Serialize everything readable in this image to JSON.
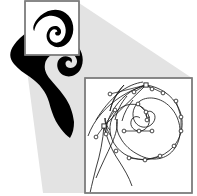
{
  "figure": {
    "background_color": "#ffffff",
    "glyph_color": "#000000",
    "callout_wedge_color": "#e3e3e3",
    "box_border_color": "#7d7d7d",
    "box_fill_color": "#ffffff",
    "curve_color": "#1b1b1b",
    "control_point_fill": "#ffffff",
    "control_point_stroke": "#1b1b1b"
  },
  "panels": {
    "source_glyph": {
      "name": "ornamental-spiral-glyph",
      "description": "Solid black ornamental glyph resembling a curled letter C with an inner spiral",
      "fill": "#000000"
    },
    "detail_box_small": {
      "name": "magnifier-selection-box",
      "x": 25,
      "y": 1,
      "width": 54,
      "height": 54,
      "border_color": "#7d7d7d",
      "fill": "#ffffff"
    },
    "detail_box_large": {
      "name": "magnified-outline-box",
      "x": 85,
      "y": 78,
      "width": 107,
      "height": 115,
      "border_color": "#7d7d7d",
      "fill": "#ffffff"
    },
    "callout_wedge": {
      "name": "zoom-callout-wedge",
      "fill": "#e3e3e3",
      "points": "79,3 192,78 192,193 43,193 25,55 79,55"
    }
  },
  "geometry": {
    "glyph_path": "M 49 10 C 44 17 38 24 29 31 C 22 36 17 40 14 45 C 9 52 9 58 14 64 C 18 69 24 73 30 77 C 40 84 46 92 49 102 C 50 106 51 109 52 112 C 54 118 57 124 61 129 C 64 133 67 136 70 138 C 73 133 74 128 74 122 C 73 113 70 104 64 96 C 59 89 54 84 50 79 C 46 74 44 69 45 64 C 46 58 51 54 58 52 C 64 50 70 51 74 55 C 77 58 78 62 76 65 C 74 68 70 69 67 67 C 65 65 65 62 67 61 C 69 60 71 61 71 63 C 73 61 72 58 69 57 C 65 55 60 57 58 61 C 56 66 58 72 63 75 C 69 78 76 76 80 70 C 85 62 83 51 76 44 C 68 36 56 34 47 39 C 44 41 41 43 39 46 C 41 41 45 36 50 31 C 56 25 61 19 63 12 C 64 8 63 5 61 4 C 57 3 52 6 49 10 Z",
    "glyph_path_magnified": "M 27 54 C 22 47 29 34 39 25 C 52 13 71 10 85 20 C 101 31 104 55 93 71 C 85 83 70 87 60 80 C 50 74 47 61 53 52 C 57 45 67 42 73 47 C 78 51 78 58 74 61 C 71 63 67 62 66 59 C 65 56 67 54 70 55 C 69 50 63 49 59 53 C 54 58 54 67 60 72 C 67 78 77 75 82 66 C 89 54 85 38 74 30 C 61 21 44 25 34 38 C 30 43 28 49 27 54 Z",
    "outline_curve": "M 96 178 C 101 166 107 154 112 143 C 116 134 118 126 117 119 M 117 119 C 116 126 117 132 120 137 C 124 145 131 151 139 155 C 152 162 167 160 175 148 C 183 136 181 120 172 109 C 163 98 149 95 140 101 C 133 106 131 115 135 122 C 139 128 147 129 152 124 C 156 120 156 114 152 112 C 149 110 146 112 146 115 C 146 117 148 118 150 117 M 110 130 C 107 127 105 123 105 118 M 105 118 C 105 124 107 131 111 136 M 124 85 C 117 93 112 102 110 111 M 110 111 C 112 101 117 92 124 85 M 96 120 C 102 110 110 100 120 92 C 128 86 136 83 143 82"
  },
  "control_points": [
    {
      "id": "cp-anchor-top",
      "shape": "square",
      "x": 146,
      "y": 85
    },
    {
      "id": "cp-node-1",
      "shape": "circle",
      "x": 163,
      "y": 93
    },
    {
      "id": "cp-node-2",
      "shape": "circle",
      "x": 152,
      "y": 89
    },
    {
      "id": "cp-node-3",
      "shape": "circle",
      "x": 134,
      "y": 92
    },
    {
      "id": "cp-node-4",
      "shape": "circle",
      "x": 176,
      "y": 101
    },
    {
      "id": "cp-node-5",
      "shape": "circle",
      "x": 181,
      "y": 117
    },
    {
      "id": "cp-node-6",
      "shape": "circle",
      "x": 181,
      "y": 131
    },
    {
      "id": "cp-node-7",
      "shape": "circle",
      "x": 174,
      "y": 146
    },
    {
      "id": "cp-node-8",
      "shape": "circle",
      "x": 160,
      "y": 156
    },
    {
      "id": "cp-node-9",
      "shape": "circle",
      "x": 145,
      "y": 160
    },
    {
      "id": "cp-node-10",
      "shape": "circle",
      "x": 129,
      "y": 158
    },
    {
      "id": "cp-node-11",
      "shape": "circle",
      "x": 116,
      "y": 151
    },
    {
      "id": "cp-node-12",
      "shape": "circle",
      "x": 139,
      "y": 131
    },
    {
      "id": "cp-node-13",
      "shape": "circle",
      "x": 152,
      "y": 131
    },
    {
      "id": "cp-node-14",
      "shape": "circle",
      "x": 124,
      "y": 131
    },
    {
      "id": "cp-node-15",
      "shape": "circle",
      "x": 146,
      "y": 112
    },
    {
      "id": "cp-node-16",
      "shape": "circle",
      "x": 147,
      "y": 120
    },
    {
      "id": "cp-node-17",
      "shape": "circle",
      "x": 138,
      "y": 104
    },
    {
      "id": "cp-node-18",
      "shape": "circle",
      "x": 106,
      "y": 134
    },
    {
      "id": "cp-node-19",
      "shape": "circle",
      "x": 96,
      "y": 137
    },
    {
      "id": "cp-node-20",
      "shape": "circle",
      "x": 115,
      "y": 110
    },
    {
      "id": "cp-node-21",
      "shape": "circle",
      "x": 110,
      "y": 94
    },
    {
      "id": "cp-anchor-mid",
      "shape": "square",
      "x": 104,
      "y": 126
    }
  ],
  "handle_segments": [
    {
      "id": "handle-top-left",
      "x1": 146,
      "y1": 85,
      "x2": 134,
      "y2": 92
    },
    {
      "id": "handle-top-right",
      "x1": 146,
      "y1": 85,
      "x2": 163,
      "y2": 93
    },
    {
      "id": "handle-top-mid",
      "x1": 146,
      "y1": 85,
      "x2": 152,
      "y2": 89
    },
    {
      "id": "handle-right-1",
      "x1": 176,
      "y1": 101,
      "x2": 181,
      "y2": 117
    },
    {
      "id": "handle-right-2",
      "x1": 181,
      "y1": 117,
      "x2": 181,
      "y2": 131
    },
    {
      "id": "handle-bot-1",
      "x1": 129,
      "y1": 158,
      "x2": 145,
      "y2": 160
    },
    {
      "id": "handle-bot-2",
      "x1": 145,
      "y1": 160,
      "x2": 160,
      "y2": 156
    },
    {
      "id": "handle-inner-1",
      "x1": 124,
      "y1": 131,
      "x2": 139,
      "y2": 131
    },
    {
      "id": "handle-inner-2",
      "x1": 139,
      "y1": 131,
      "x2": 152,
      "y2": 131
    },
    {
      "id": "handle-inner-3",
      "x1": 146,
      "y1": 112,
      "x2": 147,
      "y2": 120
    },
    {
      "id": "handle-inner-4",
      "x1": 146,
      "y1": 112,
      "x2": 138,
      "y2": 104
    },
    {
      "id": "handle-left-1",
      "x1": 104,
      "y1": 126,
      "x2": 96,
      "y2": 137
    },
    {
      "id": "handle-left-2",
      "x1": 104,
      "y1": 126,
      "x2": 106,
      "y2": 134
    },
    {
      "id": "handle-left-3",
      "x1": 104,
      "y1": 126,
      "x2": 115,
      "y2": 110
    },
    {
      "id": "handle-tip-1",
      "x1": 146,
      "y1": 85,
      "x2": 110,
      "y2": 94
    }
  ]
}
